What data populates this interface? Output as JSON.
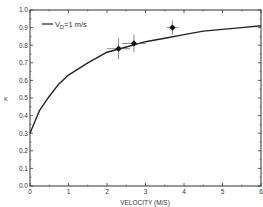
{
  "chart_data": {
    "type": "line",
    "title": "",
    "xlabel": "VELOCITY (M/S)",
    "ylabel": "K",
    "xlim": [
      0,
      6
    ],
    "ylim": [
      0.0,
      1.0
    ],
    "xticks": [
      "0",
      "1",
      "2",
      "3",
      "4",
      "5",
      "6"
    ],
    "yticks": [
      "0.0",
      "0.1",
      "0.2",
      "0.3",
      "0.4",
      "0.5",
      "0.6",
      "0.7",
      "0.8",
      "0.9",
      "1.0"
    ],
    "grid": false,
    "legend": {
      "position": "upper-left",
      "entries": [
        "V_D=1 m/s"
      ]
    },
    "series": [
      {
        "name": "V_D=1 m/s",
        "kind": "curve",
        "x": [
          0,
          0.25,
          0.5,
          0.75,
          1,
          1.5,
          2,
          2.5,
          3,
          3.5,
          4,
          4.5,
          5,
          5.5,
          6
        ],
        "values": [
          0.3,
          0.43,
          0.51,
          0.58,
          0.63,
          0.7,
          0.76,
          0.79,
          0.82,
          0.84,
          0.86,
          0.88,
          0.89,
          0.9,
          0.91
        ]
      },
      {
        "name": "measurements",
        "kind": "points-with-error-bars",
        "x": [
          2.3,
          2.7,
          3.7
        ],
        "values": [
          0.78,
          0.81,
          0.9
        ],
        "x_err": [
          0.3,
          0.3,
          0.15
        ],
        "y_err": [
          0.06,
          0.05,
          0.04
        ]
      }
    ]
  },
  "legend_label_prefix": "V",
  "legend_label_sub": "D",
  "legend_label_suffix": "=1 m/s",
  "colors": {
    "axis": "#333333",
    "curve": "#222222",
    "point": "#111111",
    "background": "#ffffff"
  }
}
